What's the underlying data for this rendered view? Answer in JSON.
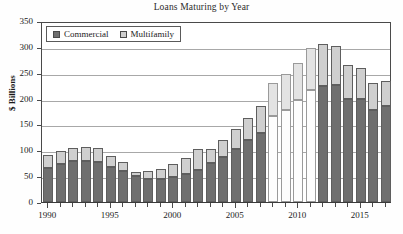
{
  "chart_data": {
    "type": "bar",
    "subtype": "stacked-bar",
    "title": "Loans Maturing by Year",
    "xlabel": "",
    "ylabel": "$ Billions",
    "ylim": [
      0,
      350
    ],
    "ytick_step": 50,
    "yticks": [
      0,
      50,
      100,
      150,
      200,
      250,
      300,
      350
    ],
    "grid": true,
    "legend_position": "top-left inside plot",
    "categories": [
      "1990",
      "1991",
      "1992",
      "1993",
      "1994",
      "1995",
      "1996",
      "1997",
      "1998",
      "1999",
      "2000",
      "2001",
      "2002",
      "2003",
      "2004",
      "2005",
      "2006",
      "2007",
      "2008",
      "2009",
      "2010",
      "2011",
      "2012",
      "2013",
      "2014",
      "2015",
      "2016",
      "2017"
    ],
    "xtick_labels": [
      "1990",
      "1995",
      "2000",
      "2005",
      "2010",
      "2015"
    ],
    "xtick_label_categories": [
      "1990",
      "1995",
      "2000",
      "2005",
      "2010",
      "2015"
    ],
    "series": [
      {
        "name": "Commercial",
        "color": "#6f6f6f",
        "values": [
          65,
          73,
          80,
          80,
          78,
          68,
          60,
          51,
          45,
          45,
          48,
          54,
          62,
          76,
          88,
          102,
          119,
          134,
          167,
          178,
          197,
          217,
          225,
          227,
          200,
          200,
          177,
          185
        ]
      },
      {
        "name": "Multifamily",
        "color": "#cfcfcf",
        "values": [
          25,
          26,
          25,
          26,
          26,
          21,
          17,
          7,
          15,
          18,
          26,
          31,
          41,
          27,
          31,
          39,
          44,
          51,
          63,
          70,
          71,
          80,
          81,
          75,
          65,
          59,
          53,
          50
        ]
      }
    ],
    "totals": [
      90,
      99,
      105,
      106,
      104,
      89,
      77,
      58,
      60,
      63,
      74,
      85,
      103,
      103,
      119,
      141,
      163,
      185,
      230,
      248,
      268,
      297,
      306,
      302,
      265,
      259,
      230,
      235
    ],
    "faded_categories": [
      "2008",
      "2009",
      "2010",
      "2011"
    ],
    "note": "Bars for 2008-2011 render with a washed-out (near-white) commercial segment in the source image."
  },
  "colors": {
    "commercial": "#6f6f6f",
    "multifamily": "#cfcfcf",
    "axis": "#4a4a4a",
    "grid": "#a8a8a8",
    "background": "#ffffff"
  }
}
